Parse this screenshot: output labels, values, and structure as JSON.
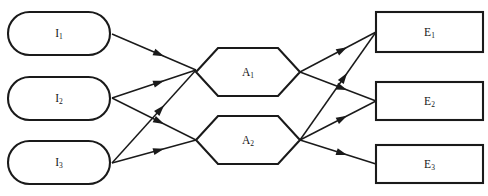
{
  "diagram": {
    "background_color": "#ffffff",
    "line_color": "#1a1a1a",
    "label_color": "#151515",
    "layers": [
      {
        "id": "inputs",
        "shape": "stadium",
        "nodes": [
          {
            "id": "I1",
            "base": "I",
            "subscript": "1",
            "label": "I1",
            "x": 8,
            "y": 12,
            "w": 102,
            "h": 43
          },
          {
            "id": "I2",
            "base": "I",
            "subscript": "2",
            "label": "I2",
            "x": 8,
            "y": 77,
            "w": 102,
            "h": 43
          },
          {
            "id": "I3",
            "base": "I",
            "subscript": "3",
            "label": "I3",
            "x": 8,
            "y": 141,
            "w": 102,
            "h": 43
          }
        ]
      },
      {
        "id": "processes",
        "shape": "hexagon",
        "nodes": [
          {
            "id": "A1",
            "base": "A",
            "subscript": "1",
            "label": "A1",
            "x": 196,
            "y": 48,
            "w": 104,
            "h": 48
          },
          {
            "id": "A2",
            "base": "A",
            "subscript": "2",
            "label": "A2",
            "x": 196,
            "y": 116,
            "w": 104,
            "h": 48
          }
        ]
      },
      {
        "id": "outputs",
        "shape": "rectangle",
        "nodes": [
          {
            "id": "E1",
            "base": "E",
            "subscript": "1",
            "label": "E1",
            "x": 376,
            "y": 12,
            "w": 107,
            "h": 40
          },
          {
            "id": "E2",
            "base": "E",
            "subscript": "2",
            "label": "E2",
            "x": 376,
            "y": 82,
            "w": 107,
            "h": 38
          },
          {
            "id": "E3",
            "base": "E",
            "subscript": "3",
            "label": "E3",
            "x": 376,
            "y": 145,
            "w": 107,
            "h": 38
          }
        ]
      }
    ],
    "edges": [
      {
        "id": "I1-A1",
        "from": "I1",
        "to": "A1",
        "x1": 112,
        "y1": 34,
        "x2": 196,
        "y2": 70,
        "arrow": true
      },
      {
        "id": "I2-A1",
        "from": "I2",
        "to": "A1",
        "x1": 112,
        "y1": 98,
        "x2": 196,
        "y2": 70,
        "arrow": true
      },
      {
        "id": "I2-A2",
        "from": "I2",
        "to": "A2",
        "x1": 112,
        "y1": 98,
        "x2": 196,
        "y2": 140,
        "arrow": true
      },
      {
        "id": "I3-A1",
        "from": "I3",
        "to": "A1",
        "x1": 112,
        "y1": 163,
        "x2": 196,
        "y2": 70,
        "arrow": true
      },
      {
        "id": "I3-A2",
        "from": "I3",
        "to": "A2",
        "x1": 112,
        "y1": 163,
        "x2": 196,
        "y2": 140,
        "arrow": true
      },
      {
        "id": "A1-E1",
        "from": "A1",
        "to": "E1",
        "x1": 300,
        "y1": 72,
        "x2": 376,
        "y2": 32,
        "arrow": true
      },
      {
        "id": "A1-E2",
        "from": "A1",
        "to": "E2",
        "x1": 300,
        "y1": 72,
        "x2": 376,
        "y2": 101,
        "arrow": true
      },
      {
        "id": "A2-E1",
        "from": "A2",
        "to": "E1",
        "x1": 300,
        "y1": 140,
        "x2": 376,
        "y2": 32,
        "arrow": true
      },
      {
        "id": "A2-E2",
        "from": "A2",
        "to": "E2",
        "x1": 300,
        "y1": 140,
        "x2": 376,
        "y2": 101,
        "arrow": true
      },
      {
        "id": "A2-E3",
        "from": "A2",
        "to": "E3",
        "x1": 300,
        "y1": 140,
        "x2": 376,
        "y2": 164,
        "arrow": true
      }
    ]
  }
}
